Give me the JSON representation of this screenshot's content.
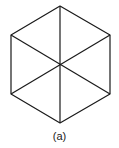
{
  "figure": {
    "caption": "(a)",
    "stroke_color": "#1a1a1a",
    "vertices": {
      "top": [
        60,
        6
      ],
      "upper_right": [
        110,
        35
      ],
      "lower_right": [
        110,
        94
      ],
      "bottom": [
        60,
        123
      ],
      "lower_left": [
        11,
        94
      ],
      "upper_left": [
        11,
        35
      ]
    },
    "center": [
      60,
      65
    ]
  }
}
